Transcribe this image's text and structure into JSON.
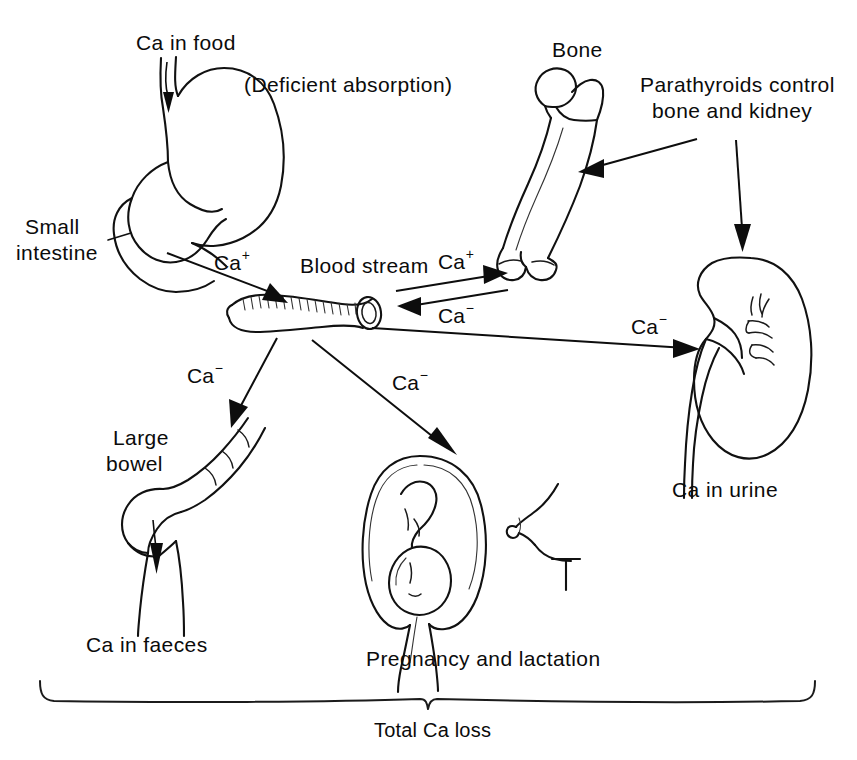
{
  "figure": {
    "title_internal": "Calcium metabolism and routes of calcium loss",
    "background_color": "#ffffff",
    "ink_color": "#0d0d0d"
  },
  "labels": {
    "ca_in_food": "Ca in food",
    "deficient_absorption": "(Deficient absorption)",
    "small_intestine_line1": "Small",
    "small_intestine_line2": "intestine",
    "bone": "Bone",
    "parathyroids_line1": "Parathyroids control",
    "parathyroids_line2": "bone and kidney",
    "blood_stream": "Blood stream",
    "large_bowel_line1": "Large",
    "large_bowel_line2": "bowel",
    "ca_in_faeces": "Ca in faeces",
    "pregnancy_and_lactation": "Pregnancy and lactation",
    "ca_in_urine": "Ca in urine",
    "total_ca_loss": "Total Ca loss"
  },
  "ion_labels": {
    "intestine_to_blood": {
      "text": "Ca",
      "charge": "+"
    },
    "blood_to_bone": {
      "text": "Ca",
      "charge": "+"
    },
    "bone_to_blood": {
      "text": "Ca",
      "charge": "−"
    },
    "blood_to_bowel": {
      "text": "Ca",
      "charge": "−"
    },
    "blood_to_uterus": {
      "text": "Ca",
      "charge": "−"
    },
    "blood_to_kidney": {
      "text": "Ca",
      "charge": "−"
    }
  },
  "organs": [
    {
      "name": "stomach-and-duodenum",
      "label": "Small intestine"
    },
    {
      "name": "femur",
      "label": "Bone"
    },
    {
      "name": "blood-vessel",
      "label": "Blood stream"
    },
    {
      "name": "kidney",
      "label": "Ca in urine"
    },
    {
      "name": "large-bowel",
      "label": "Large bowel"
    },
    {
      "name": "gravid-uterus",
      "label": "Pregnancy"
    },
    {
      "name": "breast",
      "label": "Lactation"
    }
  ],
  "flows": [
    {
      "name": "food-into-stomach",
      "from": "Ca in food",
      "to": "stomach",
      "species": "Ca"
    },
    {
      "name": "intestine-to-blood",
      "from": "small intestine",
      "to": "blood stream",
      "species": "Ca+"
    },
    {
      "name": "blood-to-bone",
      "from": "blood stream",
      "to": "bone",
      "species": "Ca+"
    },
    {
      "name": "bone-to-blood",
      "from": "bone",
      "to": "blood stream",
      "species": "Ca−"
    },
    {
      "name": "blood-to-kidney",
      "from": "blood stream",
      "to": "kidney",
      "species": "Ca−"
    },
    {
      "name": "blood-to-large-bowel",
      "from": "blood stream",
      "to": "large bowel",
      "species": "Ca−"
    },
    {
      "name": "blood-to-pregnancy",
      "from": "blood stream",
      "to": "uterus",
      "species": "Ca−"
    },
    {
      "name": "parathyroids-to-bone",
      "from": "parathyroids",
      "to": "bone",
      "species": "control"
    },
    {
      "name": "parathyroids-to-kidney",
      "from": "parathyroids",
      "to": "kidney",
      "species": "control"
    },
    {
      "name": "faeces-out",
      "from": "large bowel",
      "to": "Ca in faeces",
      "species": "Ca"
    }
  ]
}
